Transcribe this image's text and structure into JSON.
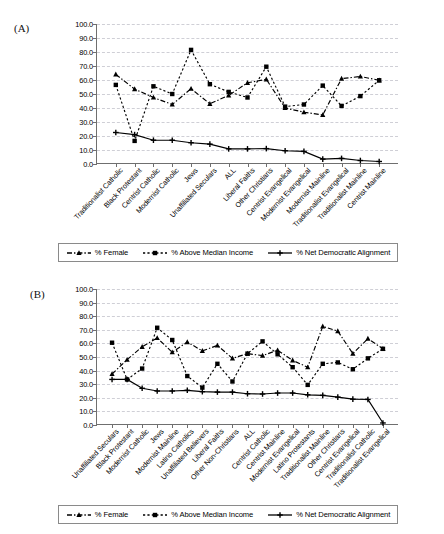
{
  "figure": {
    "panel_a_label": "(A)",
    "panel_b_label": "(B)"
  },
  "legend": {
    "items": [
      {
        "label": "% Female",
        "marker": "triangle",
        "dash": "dashdot",
        "color": "#000000"
      },
      {
        "label": "% Above Median Income",
        "marker": "square",
        "dash": "dotted",
        "color": "#000000"
      },
      {
        "label": "% Net Democratic Alignment",
        "marker": "plus",
        "dash": "solid",
        "color": "#000000"
      }
    ]
  },
  "chart_data": [
    {
      "panel": "(A)",
      "type": "line",
      "title": "",
      "xlabel": "",
      "ylabel": "",
      "ylim": [
        0,
        100
      ],
      "yticks": [
        "0.0",
        "10.0",
        "20.0",
        "30.0",
        "40.0",
        "50.0",
        "60.0",
        "70.0",
        "80.0",
        "90.0",
        "100.0"
      ],
      "grid": true,
      "legend_position": "bottom",
      "categories": [
        "Traditionalist Catholic",
        "Black Protestant",
        "Centrist Catholic",
        "Modernist Catholic",
        "Jews",
        "Unaffiliated Seculars",
        "ALL",
        "Liberal Faiths",
        "Other Christians",
        "Centrist Evangelical",
        "Modernist Evangelical",
        "Modernist Mainline",
        "Traditionalist Evangelical",
        "Traditionalist Mainline",
        "Centrist Mainline"
      ],
      "series": [
        {
          "name": "% Female",
          "marker": "triangle",
          "dash": "dashdot",
          "values": [
            64.0,
            53.5,
            47.5,
            42.5,
            53.8,
            43.0,
            49.0,
            58.0,
            60.5,
            40.0,
            37.0,
            35.0,
            61.0,
            62.5,
            59.8
          ]
        },
        {
          "name": "% Above Median Income",
          "marker": "square",
          "dash": "dotted",
          "values": [
            56.5,
            16.5,
            55.5,
            50.0,
            81.5,
            57.0,
            51.5,
            47.5,
            69.5,
            41.0,
            42.5,
            56.0,
            41.5,
            48.5,
            59.8
          ]
        },
        {
          "name": "% Net Democratic Alignment",
          "marker": "plus",
          "dash": "solid",
          "values": [
            22.5,
            21.0,
            17.0,
            17.0,
            15.2,
            14.2,
            10.8,
            10.8,
            11.0,
            9.5,
            9.0,
            3.5,
            4.0,
            2.5,
            1.8
          ]
        }
      ]
    },
    {
      "panel": "(B)",
      "type": "line",
      "title": "",
      "xlabel": "",
      "ylabel": "",
      "ylim": [
        0,
        100
      ],
      "yticks": [
        "0.0",
        "10.0",
        "20.0",
        "30.0",
        "40.0",
        "50.0",
        "60.0",
        "70.0",
        "80.0",
        "90.0",
        "100.0"
      ],
      "grid": true,
      "legend_position": "bottom",
      "categories": [
        "Unaffiliated Seculars",
        "Black Protestant",
        "Modernist Catholic",
        "Jews",
        "Modernist Mainline",
        "Latino Catholics",
        "Unaffiliated Believers",
        "Liberal Faiths",
        "Other Non-Christians",
        "ALL",
        "Centrist Catholic",
        "Centrist Mainline",
        "Modernist Evangelical",
        "Latino Protestants",
        "Traditionalist Mainline",
        "Other Christians",
        "Centrist Evangelical",
        "Traditionalist Catholic",
        "Traditionalist Evangelical"
      ],
      "series": [
        {
          "name": "% Female",
          "marker": "triangle",
          "dash": "dashdot",
          "values": [
            37.5,
            48.0,
            57.5,
            64.0,
            53.5,
            61.0,
            54.5,
            58.5,
            49.0,
            52.5,
            51.0,
            55.0,
            47.5,
            42.5,
            72.5,
            69.0,
            52.5,
            63.5,
            56.0
          ]
        },
        {
          "name": "% Above Median Income",
          "marker": "square",
          "dash": "dotted",
          "values": [
            60.5,
            33.5,
            41.5,
            71.5,
            62.5,
            36.0,
            27.5,
            45.0,
            32.0,
            52.5,
            61.5,
            52.0,
            42.5,
            29.5,
            45.0,
            46.0,
            41.0,
            49.0,
            56.0
          ]
        },
        {
          "name": "% Net Democratic Alignment",
          "marker": "plus",
          "dash": "solid",
          "values": [
            33.5,
            33.5,
            27.0,
            25.0,
            25.0,
            25.5,
            24.5,
            24.2,
            24.2,
            23.0,
            22.8,
            23.5,
            23.5,
            22.2,
            21.8,
            20.5,
            19.0,
            18.8,
            1.5
          ]
        }
      ]
    }
  ]
}
